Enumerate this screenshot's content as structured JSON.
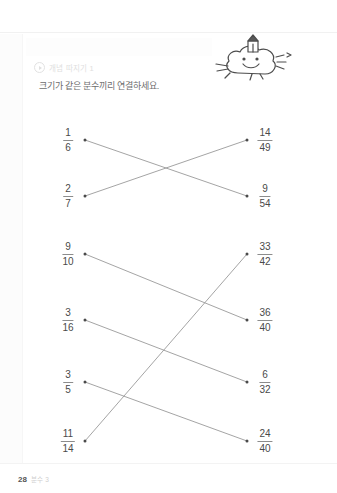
{
  "document": {
    "title": "분수 연결하기 학습지",
    "header_label": "개념 따지기 1",
    "instruction": "크기가 같은 분수끼리 연결하세요.",
    "footer": {
      "page_number": "28",
      "note": "분수 3"
    },
    "mascot": {
      "name": "smiling-cloud-mascot",
      "description": "웃는 구름 캐릭터"
    }
  },
  "colors": {
    "ink": "#4a4a4a",
    "rule": "#8c8c8c",
    "line": "#9a9a9a",
    "faint": "#dedede",
    "instruction_text": "#6d6d6d"
  },
  "exercise": {
    "groups": [
      {
        "id": "group-1",
        "left": [
          {
            "label": "1/6",
            "numerator": "1",
            "denominator": "6",
            "x": 68,
            "y": 22,
            "dot_x": 85,
            "dot_y": 22
          },
          {
            "label": "2/7",
            "numerator": "2",
            "denominator": "7",
            "x": 68,
            "y": 78,
            "dot_x": 85,
            "dot_y": 78
          }
        ],
        "right": [
          {
            "label": "14/49",
            "numerator": "14",
            "denominator": "49",
            "x": 265,
            "y": 22,
            "dot_x": 247,
            "dot_y": 22
          },
          {
            "label": "9/54",
            "numerator": "9",
            "denominator": "54",
            "x": 265,
            "y": 78,
            "dot_x": 247,
            "dot_y": 78
          }
        ],
        "connections": [
          {
            "from": "1/6",
            "to": "9/54",
            "x1": 85,
            "y1": 22,
            "x2": 247,
            "y2": 78
          },
          {
            "from": "2/7",
            "to": "14/49",
            "x1": 85,
            "y1": 78,
            "x2": 247,
            "y2": 22
          }
        ]
      },
      {
        "id": "group-2",
        "left": [
          {
            "label": "9/10",
            "numerator": "9",
            "denominator": "10",
            "x": 68,
            "y": 20,
            "dot_x": 85,
            "dot_y": 20
          },
          {
            "label": "3/16",
            "numerator": "3",
            "denominator": "16",
            "x": 68,
            "y": 86,
            "dot_x": 85,
            "dot_y": 86
          },
          {
            "label": "3/5",
            "numerator": "3",
            "denominator": "5",
            "x": 68,
            "y": 148,
            "dot_x": 85,
            "dot_y": 148
          },
          {
            "label": "11/14",
            "numerator": "11",
            "denominator": "14",
            "x": 68,
            "y": 207,
            "dot_x": 85,
            "dot_y": 207
          }
        ],
        "right": [
          {
            "label": "33/42",
            "numerator": "33",
            "denominator": "42",
            "x": 265,
            "y": 20,
            "dot_x": 247,
            "dot_y": 20
          },
          {
            "label": "36/40",
            "numerator": "36",
            "denominator": "40",
            "x": 265,
            "y": 86,
            "dot_x": 247,
            "dot_y": 86
          },
          {
            "label": "6/32",
            "numerator": "6",
            "denominator": "32",
            "x": 265,
            "y": 148,
            "dot_x": 247,
            "dot_y": 148
          },
          {
            "label": "24/40",
            "numerator": "24",
            "denominator": "40",
            "x": 265,
            "y": 207,
            "dot_x": 247,
            "dot_y": 207
          }
        ],
        "connections": [
          {
            "from": "9/10",
            "to": "36/40",
            "x1": 85,
            "y1": 20,
            "x2": 247,
            "y2": 86
          },
          {
            "from": "3/16",
            "to": "6/32",
            "x1": 85,
            "y1": 86,
            "x2": 247,
            "y2": 148
          },
          {
            "from": "3/5",
            "to": "24/40",
            "x1": 85,
            "y1": 148,
            "x2": 247,
            "y2": 207
          },
          {
            "from": "11/14",
            "to": "33/42",
            "x1": 85,
            "y1": 207,
            "x2": 247,
            "y2": 20
          }
        ]
      }
    ]
  }
}
